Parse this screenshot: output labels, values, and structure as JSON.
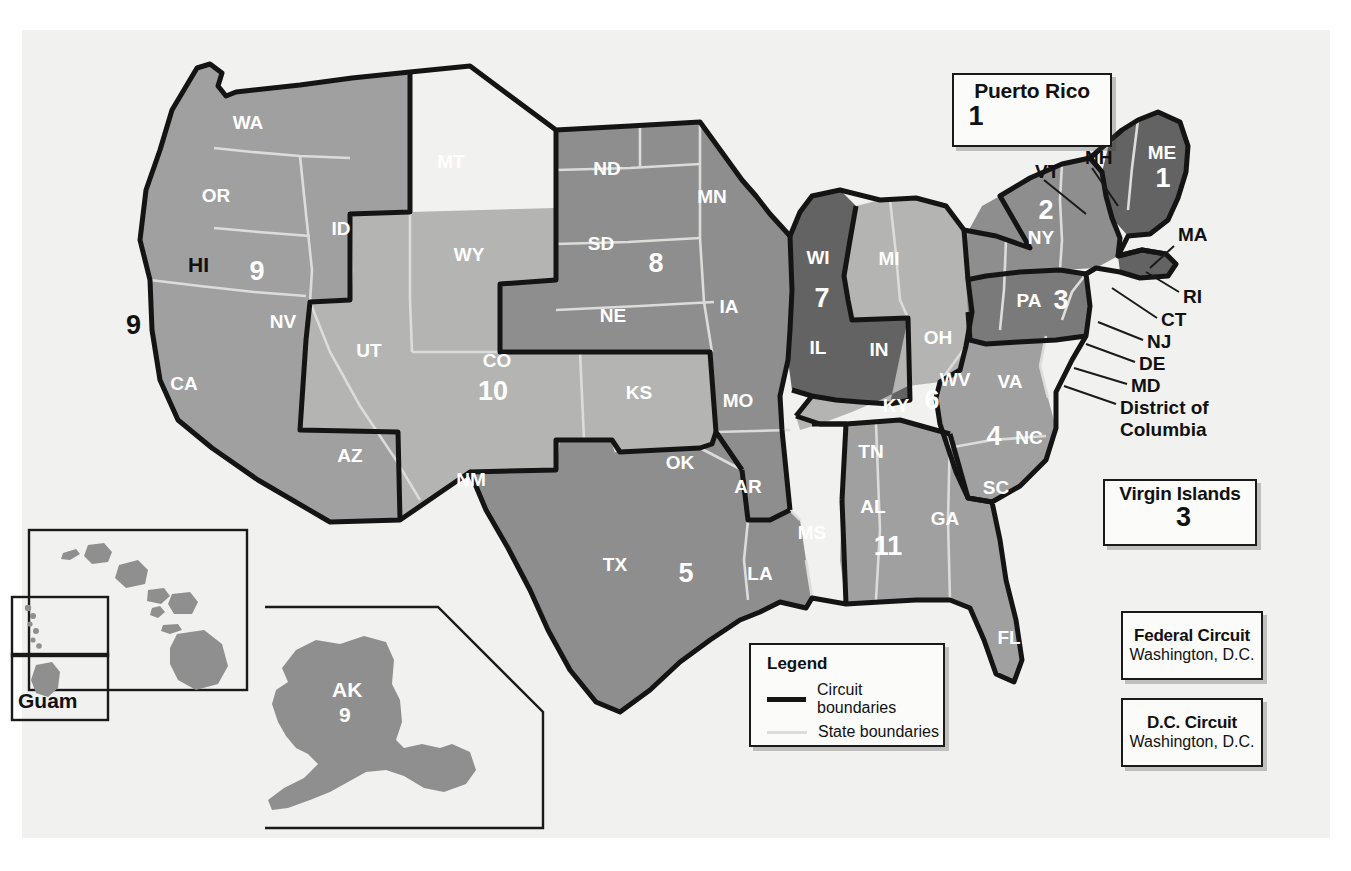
{
  "legend": {
    "title": "Legend",
    "items": [
      {
        "label": "Circuit boundaries",
        "style": "circuit",
        "color": "#141414"
      },
      {
        "label": "State boundaries",
        "style": "state",
        "color": "#dcdcda"
      }
    ]
  },
  "insets": {
    "puerto_rico": {
      "title": "Puerto Rico",
      "circuit": "1"
    },
    "virgin_islands": {
      "title": "Virgin Islands",
      "circuit": "3"
    },
    "hawaii": {
      "state": "HI",
      "circuit": "9"
    },
    "guam": {
      "title": "Guam"
    },
    "alaska": {
      "state": "AK",
      "circuit": "9"
    }
  },
  "special_courts": [
    {
      "name": "Federal Circuit",
      "location": "Washington, D.C."
    },
    {
      "name": "D.C. Circuit",
      "location": "Washington, D.C."
    }
  ],
  "circuit_numbers": [
    {
      "n": "1",
      "x": 1163,
      "y": 178
    },
    {
      "n": "2",
      "x": 1046,
      "y": 210
    },
    {
      "n": "3",
      "x": 1061,
      "y": 300
    },
    {
      "n": "4",
      "x": 994,
      "y": 436
    },
    {
      "n": "5",
      "x": 686,
      "y": 573
    },
    {
      "n": "6",
      "x": 932,
      "y": 400
    },
    {
      "n": "7",
      "x": 822,
      "y": 298
    },
    {
      "n": "8",
      "x": 656,
      "y": 263
    },
    {
      "n": "9",
      "x": 257,
      "y": 271
    },
    {
      "n": "10",
      "x": 493,
      "y": 391
    },
    {
      "n": "11",
      "x": 888,
      "y": 546
    }
  ],
  "state_labels": [
    {
      "s": "WA",
      "x": 248,
      "y": 122
    },
    {
      "s": "OR",
      "x": 216,
      "y": 195
    },
    {
      "s": "ID",
      "x": 341,
      "y": 228
    },
    {
      "s": "MT",
      "x": 451,
      "y": 161
    },
    {
      "s": "ND",
      "x": 607,
      "y": 168
    },
    {
      "s": "SD",
      "x": 601,
      "y": 243
    },
    {
      "s": "MN",
      "x": 712,
      "y": 196
    },
    {
      "s": "WY",
      "x": 469,
      "y": 254
    },
    {
      "s": "NE",
      "x": 613,
      "y": 315
    },
    {
      "s": "IA",
      "x": 729,
      "y": 306
    },
    {
      "s": "NV",
      "x": 283,
      "y": 321
    },
    {
      "s": "UT",
      "x": 369,
      "y": 350
    },
    {
      "s": "CO",
      "x": 497,
      "y": 360
    },
    {
      "s": "KS",
      "x": 639,
      "y": 392
    },
    {
      "s": "MO",
      "x": 738,
      "y": 400
    },
    {
      "s": "CA",
      "x": 184,
      "y": 383
    },
    {
      "s": "AZ",
      "x": 350,
      "y": 455
    },
    {
      "s": "NM",
      "x": 471,
      "y": 479
    },
    {
      "s": "OK",
      "x": 680,
      "y": 462
    },
    {
      "s": "AR",
      "x": 748,
      "y": 486
    },
    {
      "s": "TX",
      "x": 615,
      "y": 564
    },
    {
      "s": "LA",
      "x": 760,
      "y": 573
    },
    {
      "s": "MS",
      "x": 812,
      "y": 532
    },
    {
      "s": "AL",
      "x": 873,
      "y": 506
    },
    {
      "s": "GA",
      "x": 945,
      "y": 518
    },
    {
      "s": "FL",
      "x": 1009,
      "y": 637
    },
    {
      "s": "SC",
      "x": 996,
      "y": 487
    },
    {
      "s": "NC",
      "x": 1029,
      "y": 437
    },
    {
      "s": "TN",
      "x": 871,
      "y": 451
    },
    {
      "s": "KY",
      "x": 896,
      "y": 405
    },
    {
      "s": "WV",
      "x": 955,
      "y": 379
    },
    {
      "s": "VA",
      "x": 1010,
      "y": 381
    },
    {
      "s": "OH",
      "x": 938,
      "y": 337
    },
    {
      "s": "IN",
      "x": 879,
      "y": 349
    },
    {
      "s": "IL",
      "x": 818,
      "y": 347
    },
    {
      "s": "WI",
      "x": 818,
      "y": 257
    },
    {
      "s": "MI",
      "x": 889,
      "y": 258
    },
    {
      "s": "ME",
      "x": 1162,
      "y": 152
    },
    {
      "s": "NY",
      "x": 1041,
      "y": 237
    },
    {
      "s": "PA",
      "x": 1029,
      "y": 300
    }
  ],
  "callout_labels": [
    {
      "s": "VT",
      "x": 1035,
      "y": 171
    },
    {
      "s": "NH",
      "x": 1085,
      "y": 157
    },
    {
      "s": "MA",
      "x": 1178,
      "y": 234
    },
    {
      "s": "RI",
      "x": 1183,
      "y": 296
    },
    {
      "s": "CT",
      "x": 1161,
      "y": 319
    },
    {
      "s": "NJ",
      "x": 1147,
      "y": 341
    },
    {
      "s": "DE",
      "x": 1139,
      "y": 363
    },
    {
      "s": "MD",
      "x": 1131,
      "y": 385
    },
    {
      "s": "District of",
      "x": 1120,
      "y": 407
    },
    {
      "s": "Columbia",
      "x": 1120,
      "y": 429
    }
  ],
  "colors": {
    "background": "#ffffff",
    "canvas": "#f1f1ef",
    "circuit_boundary": "#141414",
    "state_boundary": "#dcdcda",
    "fill_lightest": "#eeeeec",
    "fill_light": "#b4b4b2",
    "fill_medium": "#a0a0a0",
    "fill_mediumdark": "#8e8e8e",
    "fill_dark": "#7a7a7a",
    "fill_darkest": "#636363",
    "inset_fill": "#8f8f8f",
    "box_fill": "#fbfbfa",
    "text_white": "#ffffff",
    "text_black": "#111111"
  }
}
